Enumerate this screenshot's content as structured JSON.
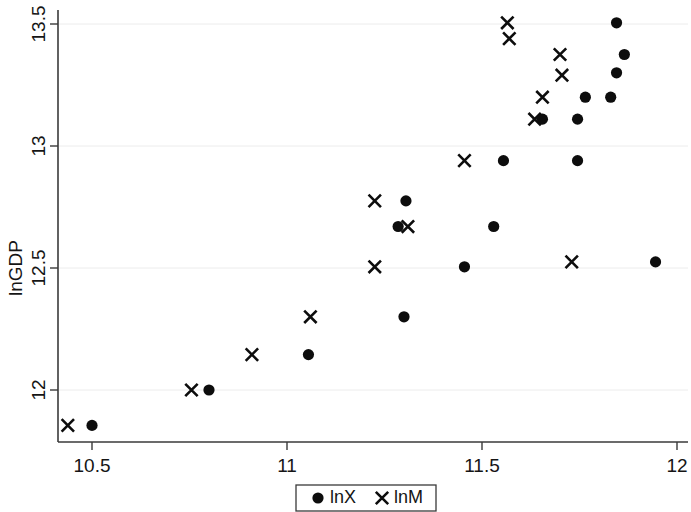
{
  "chart_data": {
    "type": "scatter",
    "title": "",
    "subtitle": "",
    "xlabel": "",
    "ylabel": "lnGDP",
    "xlim": [
      10.43,
      11.95
    ],
    "ylim": [
      11.82,
      13.54
    ],
    "xticks": [
      10.5,
      11,
      11.5,
      12
    ],
    "xtick_labels": [
      "10.5",
      "11",
      "11.5",
      "12"
    ],
    "yticks": [
      12,
      12.5,
      13,
      13.5
    ],
    "ytick_labels": [
      "12",
      "12.5",
      "13",
      "13.5"
    ],
    "grid": "horizontal-faint",
    "legend_position": "bottom-center",
    "series": [
      {
        "name": "lnX",
        "marker": "circle",
        "color": "#0d0d0d",
        "points": [
          [
            10.5,
            11.855
          ],
          [
            10.8,
            12.0
          ],
          [
            11.055,
            12.145
          ],
          [
            11.3,
            12.3
          ],
          [
            11.455,
            12.505
          ],
          [
            11.305,
            12.775
          ],
          [
            11.285,
            12.67
          ],
          [
            11.53,
            12.67
          ],
          [
            11.555,
            12.94
          ],
          [
            11.745,
            12.94
          ],
          [
            11.655,
            13.11
          ],
          [
            11.745,
            13.11
          ],
          [
            11.765,
            13.2
          ],
          [
            11.83,
            13.2
          ],
          [
            11.845,
            13.3
          ],
          [
            11.865,
            13.375
          ],
          [
            11.845,
            13.505
          ],
          [
            11.945,
            12.525
          ]
        ]
      },
      {
        "name": "lnM",
        "marker": "cross",
        "color": "#0d0d0d",
        "points": [
          [
            10.438,
            11.855
          ],
          [
            10.755,
            12.0
          ],
          [
            10.91,
            12.145
          ],
          [
            11.06,
            12.3
          ],
          [
            11.225,
            12.505
          ],
          [
            11.225,
            12.775
          ],
          [
            11.31,
            12.67
          ],
          [
            11.455,
            12.94
          ],
          [
            11.565,
            13.505
          ],
          [
            11.57,
            13.44
          ],
          [
            11.7,
            13.375
          ],
          [
            11.705,
            13.29
          ],
          [
            11.655,
            13.2
          ],
          [
            11.635,
            13.11
          ],
          [
            11.73,
            12.525
          ]
        ]
      }
    ]
  },
  "legend": {
    "entries": [
      {
        "marker": "circle",
        "label": "lnX"
      },
      {
        "marker": "cross",
        "label": "lnM"
      }
    ]
  }
}
